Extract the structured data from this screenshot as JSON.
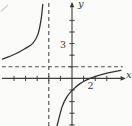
{
  "figure": {
    "background": "#fbfbf9",
    "ink_color": "#3d3d3d",
    "curve_color": "#333333",
    "dash_color": "#4d4d4d",
    "axis_labels": {
      "x": "x",
      "y": "y"
    },
    "tick_labels": {
      "y_3": "3",
      "x_2": "2"
    }
  },
  "chart_data": {
    "type": "line",
    "title": "",
    "xlabel": "x",
    "ylabel": "y",
    "xlim": [
      -6.2,
      4.8
    ],
    "ylim": [
      -4.3,
      6.6
    ],
    "grid": false,
    "legend": false,
    "x_ticks": [
      -5,
      -4,
      -3,
      -2,
      -1,
      1,
      2,
      3
    ],
    "y_ticks": [
      -4,
      -3,
      -2,
      -1,
      1,
      2,
      3,
      4,
      5
    ],
    "labeled_x_tick": 2,
    "labeled_y_tick": 3,
    "asymptotes": {
      "vertical_x": -2,
      "horizontal_y": 1,
      "style": "dashed"
    },
    "curve_x_intercept": 1.55,
    "curve_y_intercept": -1.05,
    "series": [
      {
        "name": "left-branch",
        "points": [
          [
            -6.0,
            1.66
          ],
          [
            -4.9,
            2.1
          ],
          [
            -4.05,
            2.57
          ],
          [
            -3.36,
            3.04
          ],
          [
            -2.93,
            3.82
          ],
          [
            -2.67,
            5.03
          ],
          [
            -2.52,
            6.37
          ]
        ]
      },
      {
        "name": "right-branch",
        "points": [
          [
            -1.29,
            -4.1
          ],
          [
            -0.86,
            -2.47
          ],
          [
            -0.43,
            -1.57
          ],
          [
            0,
            -1.05
          ],
          [
            0.69,
            -0.45
          ],
          [
            1.55,
            0
          ],
          [
            2.24,
            0.24
          ],
          [
            3.1,
            0.47
          ],
          [
            3.97,
            0.65
          ],
          [
            4.22,
            0.7
          ]
        ]
      }
    ]
  }
}
